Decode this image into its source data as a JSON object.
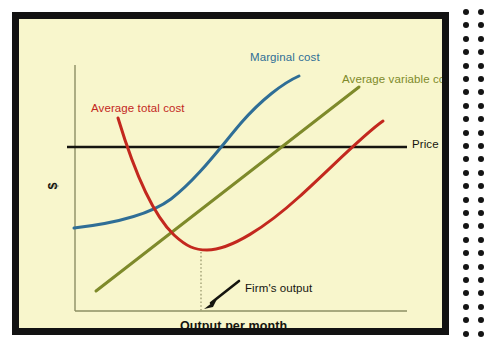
{
  "figure": {
    "background_color": "#F8F6CC",
    "frame_color": "#121212",
    "page_background": "#ffffff"
  },
  "axes": {
    "y_label": "$",
    "x_label": "Output per month",
    "axis_color": "#8C8F63"
  },
  "annotations": {
    "firms_output": "Firm's output",
    "price": "Price"
  },
  "binder": {
    "dot_color": "#141414",
    "columns": 2,
    "rows": 25
  },
  "chart_data": {
    "type": "line",
    "title": "",
    "xlabel": "Output per month",
    "ylabel": "$",
    "grid": false,
    "legend": "inline-labels",
    "xlim": [
      0,
      1
    ],
    "ylim": [
      0,
      1
    ],
    "annotations": [
      {
        "name": "firms-output",
        "text": "Firm's output",
        "points_to": "minimum of average total cost on x-axis",
        "arrow": true
      }
    ],
    "series": [
      {
        "name": "Marginal cost",
        "label": "Marginal cost",
        "color": "#2F6E96",
        "shape": "u-shaped rising",
        "points": [
          [
            55,
            209
          ],
          [
            75,
            205
          ],
          [
            97,
            201
          ],
          [
            120,
            195
          ],
          [
            142,
            186
          ],
          [
            162,
            173
          ],
          [
            180,
            157
          ],
          [
            198,
            138
          ],
          [
            215,
            117
          ],
          [
            232,
            97
          ],
          [
            250,
            79
          ],
          [
            266,
            64
          ],
          [
            280,
            57
          ]
        ]
      },
      {
        "name": "Average variable costs",
        "label": "Average variable costs",
        "color": "#7E8A2A",
        "shape": "linear rising",
        "points": [
          [
            77,
            272
          ],
          [
            340,
            68
          ]
        ]
      },
      {
        "name": "Average total cost",
        "label": "Average total cost",
        "color": "#C3281E",
        "shape": "u-shaped",
        "points": [
          [
            99,
            99
          ],
          [
            108,
            124
          ],
          [
            118,
            150
          ],
          [
            130,
            176
          ],
          [
            143,
            199
          ],
          [
            157,
            216
          ],
          [
            170,
            227
          ],
          [
            182,
            231
          ],
          [
            196,
            231
          ],
          [
            212,
            227
          ],
          [
            230,
            219
          ],
          [
            248,
            206
          ],
          [
            266,
            191
          ],
          [
            286,
            172
          ],
          [
            306,
            152
          ],
          [
            326,
            132
          ],
          [
            346,
            114
          ],
          [
            364,
            102
          ]
        ]
      },
      {
        "name": "Price",
        "label": "Price",
        "color": "#15150F",
        "shape": "horizontal",
        "points": [
          [
            56,
            128
          ],
          [
            388,
            128
          ]
        ]
      }
    ],
    "markers": {
      "firm_output_dotted_line": {
        "x": 182,
        "y_top": 231,
        "y_bottom": 292
      }
    }
  }
}
